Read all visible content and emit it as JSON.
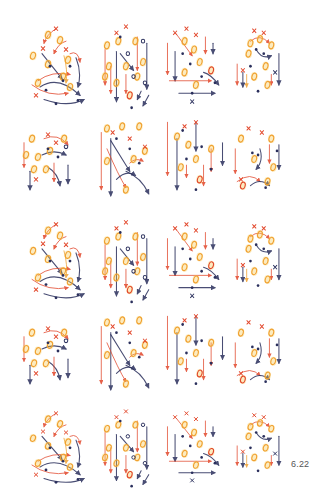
{
  "page": {
    "number_label": "6.22"
  },
  "colors": {
    "red": "#e2462a",
    "orange": "#f0a030",
    "yellow": "#f6c84a",
    "navy": "#2a2f5c",
    "blue": "#3c4a8c"
  },
  "layout": {
    "rows": [
      {
        "y": 12,
        "h": 100
      },
      {
        "y": 108,
        "h": 98
      },
      {
        "y": 208,
        "h": 98
      },
      {
        "y": 302,
        "h": 98
      },
      {
        "y": 398,
        "h": 92
      }
    ],
    "cols": [
      {
        "x": 8,
        "w": 78
      },
      {
        "x": 88,
        "w": 74
      },
      {
        "x": 158,
        "w": 74
      },
      {
        "x": 222,
        "w": 74
      }
    ]
  },
  "diagram_types": {
    "A": {
      "marks": [
        [
          "o",
          40,
          22,
          "orange"
        ],
        [
          "o",
          52,
          27,
          "orange"
        ],
        [
          "o",
          25,
          42,
          "orange"
        ],
        [
          "o",
          40,
          50,
          "orange"
        ],
        [
          "o",
          60,
          46,
          "orange"
        ],
        [
          "o",
          30,
          68,
          "orange"
        ],
        [
          "o",
          55,
          62,
          "orange"
        ],
        [
          "o",
          62,
          72,
          "orange"
        ],
        [
          "x",
          48,
          16,
          "red"
        ],
        [
          "x",
          58,
          36,
          "red"
        ],
        [
          "x",
          35,
          35,
          "red"
        ],
        [
          "x",
          28,
          80,
          "red"
        ],
        [
          "d",
          42,
          52,
          "navy"
        ],
        [
          "d",
          55,
          66,
          "navy"
        ],
        [
          "d",
          70,
          85,
          "navy"
        ],
        [
          "d",
          48,
          88,
          "navy"
        ],
        [
          "d",
          38,
          75,
          "navy"
        ],
        [
          "d",
          62,
          52,
          "navy"
        ]
      ],
      "lines": [
        [
          "M48 16 Q38 22 36 30",
          "red"
        ],
        [
          "M58 28 Q50 30 46 40",
          "red"
        ],
        [
          "M34 40 L54 64",
          "navy"
        ],
        [
          "M68 44 Q74 58 70 72",
          "navy"
        ],
        [
          "M30 66 Q44 56 62 60",
          "red"
        ],
        [
          "M32 72 Q50 60 72 80",
          "navy"
        ],
        [
          "M36 84 Q60 92 76 84",
          "navy"
        ],
        [
          "M24 70 Q40 82 60 78",
          "red"
        ],
        [
          "M62 40 Q70 36 72 48",
          "red"
        ],
        [
          "M56 42 Q60 56 58 68",
          "orange"
        ]
      ]
    },
    "B": {
      "marks": [
        [
          "o",
          20,
          32,
          "orange"
        ],
        [
          "o",
          32,
          28,
          "orange"
        ],
        [
          "o",
          50,
          28,
          "orange"
        ],
        [
          "o",
          22,
          52,
          "orange"
        ],
        [
          "o",
          40,
          52,
          "orange"
        ],
        [
          "o",
          58,
          48,
          "orange"
        ],
        [
          "o",
          18,
          62,
          "orange"
        ],
        [
          "o",
          30,
          68,
          "orange"
        ],
        [
          "o",
          52,
          62,
          "orange"
        ],
        [
          "o",
          44,
          80,
          "red"
        ],
        [
          "c",
          58,
          28,
          "navy"
        ],
        [
          "c",
          42,
          40,
          "navy"
        ],
        [
          "c",
          60,
          68,
          "navy"
        ],
        [
          "c",
          48,
          62,
          "navy"
        ],
        [
          "d",
          34,
          24,
          "navy"
        ],
        [
          "d",
          46,
          92,
          "navy"
        ],
        [
          "x",
          40,
          14,
          "red"
        ],
        [
          "x",
          30,
          20,
          "red"
        ]
      ],
      "lines": [
        [
          "M18 36 L18 70",
          "red"
        ],
        [
          "M30 38 L30 86",
          "navy"
        ],
        [
          "M52 24 L52 56",
          "red"
        ],
        [
          "M62 30 L62 74",
          "navy"
        ],
        [
          "M34 40 L48 56",
          "navy"
        ],
        [
          "M24 52 L24 78",
          "red"
        ],
        [
          "M40 60 L40 78",
          "red"
        ],
        [
          "M56 76 L52 84",
          "navy"
        ],
        [
          "M64 80 L58 90",
          "navy"
        ]
      ]
    },
    "C": {
      "marks": [
        [
          "o",
          28,
          28,
          "orange"
        ],
        [
          "o",
          38,
          36,
          "orange"
        ],
        [
          "o",
          44,
          48,
          "orange"
        ],
        [
          "o",
          28,
          58,
          "orange"
        ],
        [
          "o",
          40,
          70,
          "orange"
        ],
        [
          "o",
          56,
          56,
          "red"
        ],
        [
          "d",
          26,
          40,
          "navy"
        ],
        [
          "d",
          34,
          50,
          "navy"
        ],
        [
          "d",
          46,
          62,
          "navy"
        ],
        [
          "d",
          60,
          68,
          "navy"
        ],
        [
          "d",
          36,
          78,
          "navy"
        ],
        [
          "x",
          18,
          20,
          "red"
        ],
        [
          "x",
          30,
          16,
          "red"
        ],
        [
          "x",
          40,
          22,
          "red"
        ],
        [
          "x",
          36,
          86,
          "navy"
        ]
      ],
      "lines": [
        [
          "M10 30 L10 60",
          "red"
        ],
        [
          "M18 38 L18 66",
          "navy"
        ],
        [
          "M12 66 L56 66",
          "red"
        ],
        [
          "M22 78 L60 78",
          "navy"
        ],
        [
          "M48 58 Q56 60 64 70",
          "navy"
        ],
        [
          "M50 24 L50 40",
          "red"
        ],
        [
          "M58 30 L58 40",
          "navy"
        ],
        [
          "M20 22 L36 42",
          "red"
        ]
      ]
    },
    "D": {
      "marks": [
        [
          "o",
          30,
          30,
          "orange"
        ],
        [
          "o",
          40,
          26,
          "orange"
        ],
        [
          "o",
          52,
          32,
          "orange"
        ],
        [
          "o",
          28,
          40,
          "orange"
        ],
        [
          "o",
          46,
          52,
          "orange"
        ],
        [
          "o",
          34,
          62,
          "orange"
        ],
        [
          "o",
          48,
          70,
          "orange"
        ],
        [
          "d",
          36,
          36,
          "navy"
        ],
        [
          "d",
          44,
          40,
          "navy"
        ],
        [
          "d",
          38,
          76,
          "navy"
        ],
        [
          "d",
          30,
          52,
          "navy"
        ],
        [
          "x",
          34,
          18,
          "red"
        ],
        [
          "x",
          44,
          20,
          "red"
        ],
        [
          "x",
          22,
          56,
          "red"
        ],
        [
          "x",
          56,
          58,
          "navy"
        ]
      ],
      "lines": [
        [
          "M16 50 L16 70",
          "red"
        ],
        [
          "M22 58 L22 72",
          "navy"
        ],
        [
          "M60 40 L60 70",
          "navy"
        ],
        [
          "M30 28 Q40 20 50 30",
          "red"
        ],
        [
          "M36 36 Q42 46 52 42",
          "navy"
        ],
        [
          "M26 60 L26 72",
          "orange"
        ],
        [
          "M52 60 L52 70",
          "red"
        ]
      ]
    },
    "E": {
      "marks": [
        [
          "o",
          24,
          30,
          "orange"
        ],
        [
          "o",
          18,
          46,
          "orange"
        ],
        [
          "o",
          26,
          60,
          "orange"
        ],
        [
          "o",
          30,
          48,
          "orange"
        ],
        [
          "o",
          42,
          42,
          "orange"
        ],
        [
          "o",
          38,
          60,
          "orange"
        ],
        [
          "o",
          56,
          30,
          "orange"
        ],
        [
          "d",
          40,
          40,
          "navy"
        ],
        [
          "d",
          50,
          48,
          "navy"
        ],
        [
          "c",
          58,
          38,
          "navy"
        ],
        [
          "x",
          40,
          26,
          "red"
        ],
        [
          "x",
          48,
          34,
          "red"
        ],
        [
          "x",
          28,
          70,
          "red"
        ]
      ],
      "lines": [
        [
          "M16 34 L16 58",
          "red"
        ],
        [
          "M22 62 L22 80",
          "navy"
        ],
        [
          "M36 30 Q50 24 60 36",
          "red"
        ],
        [
          "M34 46 Q46 40 58 46",
          "navy"
        ],
        [
          "M40 58 Q50 64 52 76",
          "navy"
        ],
        [
          "M60 56 L60 74",
          "navy"
        ],
        [
          "M46 54 L46 72",
          "red"
        ]
      ]
    },
    "F": {
      "marks": [
        [
          "o",
          20,
          20,
          "orange"
        ],
        [
          "o",
          36,
          18,
          "orange"
        ],
        [
          "o",
          54,
          18,
          "orange"
        ],
        [
          "o",
          20,
          52,
          "orange"
        ],
        [
          "o",
          48,
          50,
          "orange"
        ],
        [
          "o",
          60,
          42,
          "orange"
        ],
        [
          "o",
          40,
          80,
          "orange"
        ],
        [
          "d",
          30,
          30,
          "navy"
        ],
        [
          "d",
          44,
          40,
          "navy"
        ],
        [
          "d",
          54,
          54,
          "navy"
        ],
        [
          "x",
          26,
          24,
          "red"
        ],
        [
          "x",
          44,
          30,
          "red"
        ],
        [
          "x",
          60,
          38,
          "red"
        ]
      ],
      "lines": [
        [
          "M14 24 L14 80",
          "red"
        ],
        [
          "M24 30 L24 86",
          "navy"
        ],
        [
          "M20 40 Q32 66 40 78",
          "red"
        ],
        [
          "M24 32 L44 62",
          "navy"
        ],
        [
          "M40 62 Q56 68 64 84",
          "navy"
        ],
        [
          "M44 54 Q50 48 58 52",
          "red"
        ],
        [
          "M30 70 Q40 60 50 66",
          "navy"
        ]
      ]
    },
    "G": {
      "marks": [
        [
          "o",
          20,
          28,
          "orange"
        ],
        [
          "o",
          32,
          36,
          "orange"
        ],
        [
          "o",
          40,
          50,
          "orange"
        ],
        [
          "o",
          24,
          58,
          "orange"
        ],
        [
          "o",
          44,
          70,
          "red"
        ],
        [
          "o",
          56,
          40,
          "orange"
        ],
        [
          "d",
          26,
          22,
          "navy"
        ],
        [
          "d",
          46,
          38,
          "navy"
        ],
        [
          "d",
          30,
          50,
          "navy"
        ],
        [
          "d",
          56,
          60,
          "navy"
        ],
        [
          "d",
          40,
          80,
          "navy"
        ],
        [
          "x",
          40,
          14,
          "red"
        ],
        [
          "x",
          28,
          18,
          "red"
        ]
      ],
      "lines": [
        [
          "M10 14 L10 66",
          "red"
        ],
        [
          "M20 30 L20 80",
          "navy"
        ],
        [
          "M40 14 L40 42",
          "navy"
        ],
        [
          "M56 40 L56 62",
          "red"
        ],
        [
          "M68 34 L68 56",
          "navy"
        ],
        [
          "M30 56 L30 68",
          "red"
        ],
        [
          "M48 56 L48 76",
          "red"
        ]
      ]
    },
    "H": {
      "marks": [
        [
          "o",
          20,
          30,
          "orange"
        ],
        [
          "o",
          52,
          30,
          "orange"
        ],
        [
          "o",
          34,
          50,
          "orange"
        ],
        [
          "o",
          54,
          58,
          "orange"
        ],
        [
          "o",
          48,
          72,
          "orange"
        ],
        [
          "o",
          22,
          76,
          "red"
        ],
        [
          "d",
          32,
          44,
          "navy"
        ],
        [
          "d",
          38,
          46,
          "navy"
        ],
        [
          "d",
          46,
          78,
          "navy"
        ],
        [
          "d",
          58,
          42,
          "navy"
        ],
        [
          "x",
          28,
          20,
          "red"
        ],
        [
          "x",
          42,
          24,
          "red"
        ],
        [
          "x",
          20,
          70,
          "red"
        ]
      ],
      "lines": [
        [
          "M14 40 L14 64",
          "red"
        ],
        [
          "M40 40 Q44 52 36 60",
          "navy"
        ],
        [
          "M50 36 L50 54",
          "red"
        ],
        [
          "M60 36 L60 60",
          "navy"
        ],
        [
          "M16 72 Q30 62 40 72",
          "red"
        ],
        [
          "M30 76 Q40 68 50 76",
          "navy"
        ]
      ]
    }
  },
  "grid": [
    [
      "A",
      "B",
      "C",
      "D"
    ],
    [
      "E",
      "F",
      "G",
      "H"
    ],
    [
      "A",
      "B",
      "C",
      "D"
    ],
    [
      "E",
      "F",
      "G",
      "H"
    ],
    [
      "A",
      "B",
      "C",
      "D"
    ]
  ]
}
